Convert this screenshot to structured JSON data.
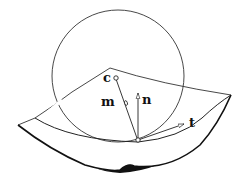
{
  "diagram": {
    "labels": {
      "center": "c",
      "m_vector": "m",
      "n_vector": "n",
      "t_vector": "t"
    },
    "colors": {
      "stroke": "#222222",
      "background": "#ffffff"
    }
  }
}
